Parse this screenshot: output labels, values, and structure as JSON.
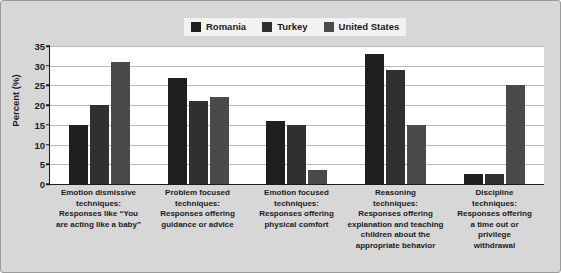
{
  "chart_data": {
    "type": "bar",
    "title": "",
    "subtitle": "",
    "xlabel": "",
    "ylabel": "Percent (%)",
    "ylim": [
      0,
      35
    ],
    "yticks": [
      0,
      5,
      10,
      15,
      20,
      25,
      30,
      35
    ],
    "grid": true,
    "legend_position": "top-center",
    "categories": [
      "Emotion dismissive techniques: Responses like “You are acting like a baby”",
      "Problem focused techniques: Responses offering guidance or advice",
      "Emotion focused techniques: Responses offering physical comfort",
      "Reasoning techniques: Responses offering explanation and teaching children about the appropriate behavior",
      "Discipline techniques: Responses offering a time out or privilege withdrawal"
    ],
    "category_lines": [
      [
        "Emotion dismissive",
        "techniques:",
        "Responses like “You",
        "are acting like a baby”"
      ],
      [
        "Problem focused",
        "techniques:",
        "Responses offering",
        "guidance or advice"
      ],
      [
        "Emotion focused",
        "techniques:",
        "Responses offering",
        "physical comfort"
      ],
      [
        "Reasoning",
        "techniques:",
        "Responses offering",
        "explanation and teaching",
        "children about the",
        "appropriate behavior"
      ],
      [
        "Discipline",
        "techniques:",
        "Responses offering",
        "a time out or",
        "privilege",
        "withdrawal"
      ]
    ],
    "series": [
      {
        "name": "Romania",
        "color": "#1e1e1e",
        "values": [
          15,
          27,
          16,
          33,
          2.5
        ]
      },
      {
        "name": "Turkey",
        "color": "#303030",
        "values": [
          20,
          21,
          15,
          29,
          2.5
        ]
      },
      {
        "name": "United States",
        "color": "#4a4a4a",
        "values": [
          31,
          22,
          3.5,
          15,
          25
        ]
      }
    ]
  },
  "legend": {
    "items": [
      {
        "label": "Romania",
        "swatch_color": "#1e1e1e",
        "icon": "legend-swatch-icon"
      },
      {
        "label": "Turkey",
        "swatch_color": "#303030",
        "icon": "legend-swatch-icon"
      },
      {
        "label": "United States",
        "swatch_color": "#4a4a4a",
        "icon": "legend-swatch-icon"
      }
    ]
  },
  "axis": {
    "y_title": "Percent (%)",
    "y_tick_labels": [
      "0",
      "5",
      "10",
      "15",
      "20",
      "25",
      "30",
      "35"
    ]
  },
  "colors": {
    "figure_background": "#d7d7d7",
    "plot_background": "#ffffff",
    "axis": "#1b1b1b",
    "gridline": "#b9b9b9",
    "text": "#1b1b1b"
  }
}
